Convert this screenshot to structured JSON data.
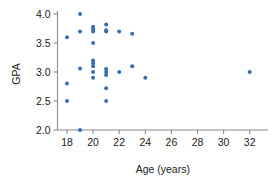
{
  "chart_data": {
    "type": "scatter",
    "title": "",
    "xlabel": "Age (years)",
    "ylabel": "GPA",
    "xlim": [
      16.9,
      33.1
    ],
    "ylim": [
      1.85,
      4.12
    ],
    "grid": false,
    "legend": null,
    "point_color": "#3a6cb5",
    "axis_color": "#8a8a8a",
    "text_color": "#1a1a1a",
    "xticks": [
      18,
      20,
      22,
      24,
      26,
      28,
      30,
      32
    ],
    "xticklabels": [
      "18",
      "20",
      "22",
      "24",
      "26",
      "28",
      "30",
      "32"
    ],
    "yticks": [
      2.0,
      2.5,
      3.0,
      3.5,
      4.0
    ],
    "yticklabels": [
      "2.0",
      "2.5",
      "3.0",
      "3.5",
      "4.0"
    ],
    "x": [
      18,
      18,
      18,
      19,
      19,
      19,
      19,
      20,
      20,
      20,
      20,
      20,
      20,
      20,
      20,
      20,
      21,
      21,
      21,
      21,
      21,
      21,
      21,
      21,
      22,
      22,
      23,
      23,
      24,
      32
    ],
    "y": [
      3.6,
      2.8,
      2.5,
      4.0,
      3.7,
      3.06,
      2.0,
      3.78,
      3.74,
      3.7,
      3.5,
      3.2,
      3.15,
      3.1,
      3.0,
      2.9,
      3.82,
      3.72,
      3.7,
      3.05,
      3.0,
      2.95,
      2.72,
      2.5,
      3.7,
      3.0,
      3.66,
      3.1,
      2.9,
      3.0
    ],
    "points": [
      {
        "x": 18,
        "y": 3.6
      },
      {
        "x": 18,
        "y": 2.8
      },
      {
        "x": 18,
        "y": 2.5
      },
      {
        "x": 19,
        "y": 4.0
      },
      {
        "x": 19,
        "y": 3.7
      },
      {
        "x": 19,
        "y": 3.06
      },
      {
        "x": 19,
        "y": 2.0
      },
      {
        "x": 20,
        "y": 3.78
      },
      {
        "x": 20,
        "y": 3.74
      },
      {
        "x": 20,
        "y": 3.7
      },
      {
        "x": 20,
        "y": 3.5
      },
      {
        "x": 20,
        "y": 3.2
      },
      {
        "x": 20,
        "y": 3.15
      },
      {
        "x": 20,
        "y": 3.1
      },
      {
        "x": 20,
        "y": 3.0
      },
      {
        "x": 20,
        "y": 2.9
      },
      {
        "x": 21,
        "y": 3.82
      },
      {
        "x": 21,
        "y": 3.72
      },
      {
        "x": 21,
        "y": 3.7
      },
      {
        "x": 21,
        "y": 3.05
      },
      {
        "x": 21,
        "y": 3.0
      },
      {
        "x": 21,
        "y": 2.95
      },
      {
        "x": 21,
        "y": 2.72
      },
      {
        "x": 21,
        "y": 2.5
      },
      {
        "x": 22,
        "y": 3.7
      },
      {
        "x": 22,
        "y": 3.0
      },
      {
        "x": 23,
        "y": 3.66
      },
      {
        "x": 23,
        "y": 3.1
      },
      {
        "x": 24,
        "y": 2.9
      },
      {
        "x": 32,
        "y": 3.0
      }
    ]
  }
}
